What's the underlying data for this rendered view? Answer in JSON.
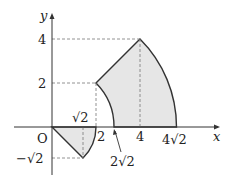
{
  "diagram": {
    "type": "coordinate-region-plot",
    "axes": {
      "x_label": "x",
      "y_label": "y",
      "origin_label": "O"
    },
    "tick_labels": {
      "y_4": "4",
      "y_2": "2",
      "x_sqrt2": "√2",
      "x_2": "2",
      "x_2sqrt2": "2√2",
      "x_4": "4",
      "x_4sqrt2": "4√2",
      "y_neg_sqrt2": "−√2"
    },
    "colors": {
      "fill": "#e6e6e6",
      "stroke": "#333333",
      "dashed": "#666666"
    },
    "regions": [
      {
        "name": "lower-region",
        "vertices": [
          "(0,0)",
          "(√2,−√2)",
          "(2,0)"
        ],
        "description": "Region bounded by line from origin to (√2,−√2) and arc of radius 2 from (√2,−√2) to (2,0)"
      },
      {
        "name": "upper-region",
        "vertices": [
          "(2,2)",
          "(4,4)",
          "(4√2,0)",
          "(2√2,0)"
        ],
        "description": "Annular sector between radius 2√2 and 4√2, from angle 0 to 45 degrees"
      }
    ]
  }
}
